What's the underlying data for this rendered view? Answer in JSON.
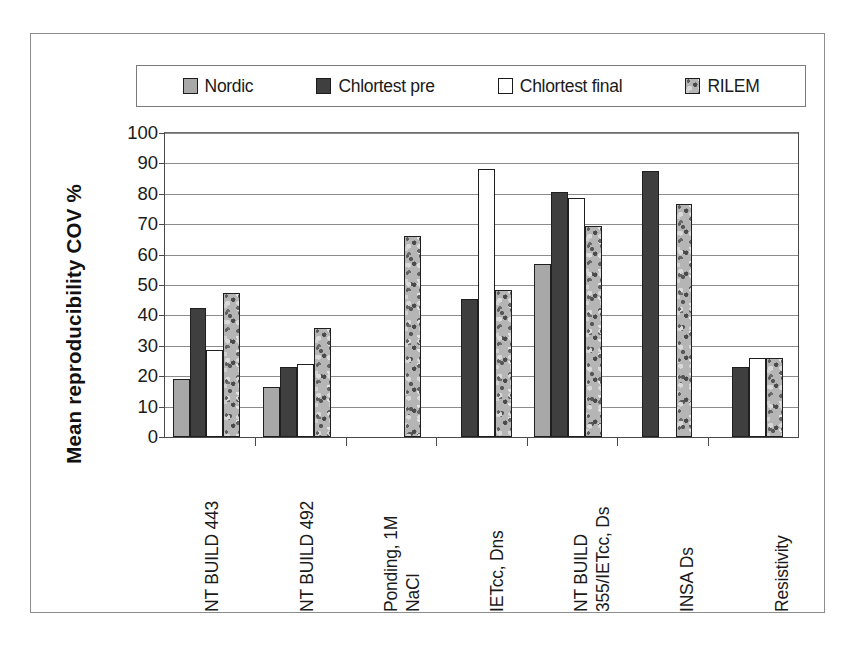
{
  "chart_data": {
    "type": "bar",
    "title": "",
    "xlabel": "",
    "ylabel": "Mean  reproducibility COV %",
    "ylim": [
      0,
      100
    ],
    "ytick_step": 10,
    "yticks": [
      100,
      90,
      80,
      70,
      60,
      50,
      40,
      30,
      20,
      10,
      0
    ],
    "grid": true,
    "legend_position": "top",
    "categories": [
      "NT BUILD 443",
      "NT BUILD 492",
      "Ponding, 1M NaCl",
      "IETcc, Dns",
      "NT BUILD 355/IETcc, Ds",
      "INSA Ds",
      "Resistivity"
    ],
    "category_lines": [
      [
        "NT BUILD 443"
      ],
      [
        "NT BUILD 492"
      ],
      [
        "Ponding, 1M",
        "NaCl"
      ],
      [
        "IETcc, Dns"
      ],
      [
        "NT BUILD",
        "355/IETcc, Ds"
      ],
      [
        "INSA Ds"
      ],
      [
        "Resistivity"
      ]
    ],
    "series": [
      {
        "name": "Nordic",
        "fill": "nordic",
        "color": "#a8a8a8",
        "values": [
          19,
          16.5,
          0,
          0,
          57,
          0,
          0
        ]
      },
      {
        "name": "Chlortest pre",
        "fill": "pre",
        "color": "#3f3f3f",
        "values": [
          42.5,
          23,
          0,
          45.5,
          80.5,
          87.5,
          23
        ]
      },
      {
        "name": "Chlortest final",
        "fill": "final",
        "color": "#ffffff",
        "values": [
          28.5,
          24,
          0,
          88,
          78.5,
          0,
          26
        ]
      },
      {
        "name": "RILEM",
        "fill": "rilem",
        "color": "#b5b5b5",
        "values": [
          47.5,
          36,
          66,
          48.5,
          69.5,
          76.5,
          26
        ]
      }
    ]
  },
  "legend": {
    "items": [
      {
        "label": "Nordic",
        "fill": "nordic"
      },
      {
        "label": "Chlortest pre",
        "fill": "pre"
      },
      {
        "label": "Chlortest final",
        "fill": "final"
      },
      {
        "label": "RILEM",
        "fill": "rilem"
      }
    ]
  }
}
